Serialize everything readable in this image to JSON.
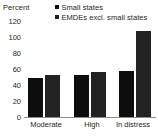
{
  "chart_data": {
    "type": "bar",
    "title": "",
    "xlabel": "",
    "ylabel": "Percent",
    "categories": [
      "Moderate",
      "High",
      "In distress"
    ],
    "series": [
      {
        "name": "Small states",
        "values": [
          49,
          52,
          58
        ],
        "color": "#0d0d0d"
      },
      {
        "name": "EMDEs excl. small states",
        "values": [
          52,
          56,
          107
        ],
        "color": "#222222"
      }
    ],
    "ylim": [
      0,
      120
    ],
    "yticks": [
      0,
      20,
      40,
      60,
      80,
      100,
      120
    ],
    "ytick_labels": [
      "0",
      "20",
      "40",
      "60",
      "80",
      "100",
      "120"
    ],
    "grid": false,
    "legend_position": "top-right"
  },
  "axis": {
    "unit_label": "Percent",
    "tick_0": "0",
    "tick_20": "20",
    "tick_40": "40",
    "tick_60": "60",
    "tick_80": "80",
    "tick_100": "100",
    "tick_120": "120"
  },
  "legend": {
    "item_1_label": "Small states",
    "item_2_label": "EMDEs excl. small states"
  },
  "categories": {
    "cat_1": "Moderate",
    "cat_2": "High",
    "cat_3": "In distress"
  }
}
